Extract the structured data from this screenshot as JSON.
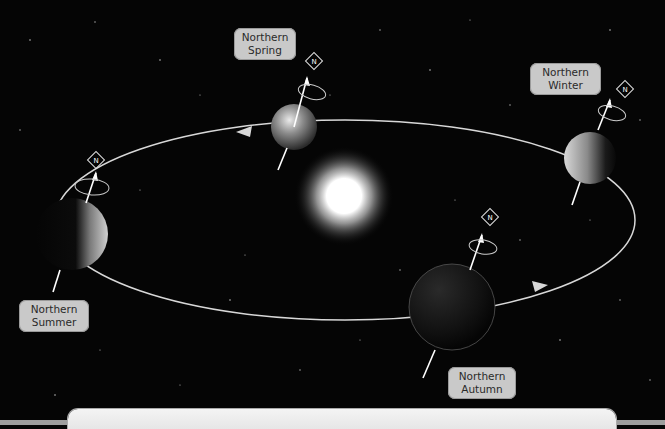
{
  "diagram": {
    "center": "sun",
    "positions": [
      {
        "id": "spring",
        "label_line1": "Northern",
        "label_line2": "Spring"
      },
      {
        "id": "winter",
        "label_line1": "Northern",
        "label_line2": "Winter"
      },
      {
        "id": "summer",
        "label_line1": "Northern",
        "label_line2": "Summer"
      },
      {
        "id": "autumn",
        "label_line1": "Northern",
        "label_line2": "Autumn"
      }
    ],
    "axis_marker_glyph": "N",
    "colors": {
      "background": "#050505",
      "orbit": "#d8d8d8",
      "label_bg": "#c9c9c9",
      "label_text": "#2a2a2a",
      "sun": "#ffffff",
      "panel": "#f0f0f0"
    }
  }
}
